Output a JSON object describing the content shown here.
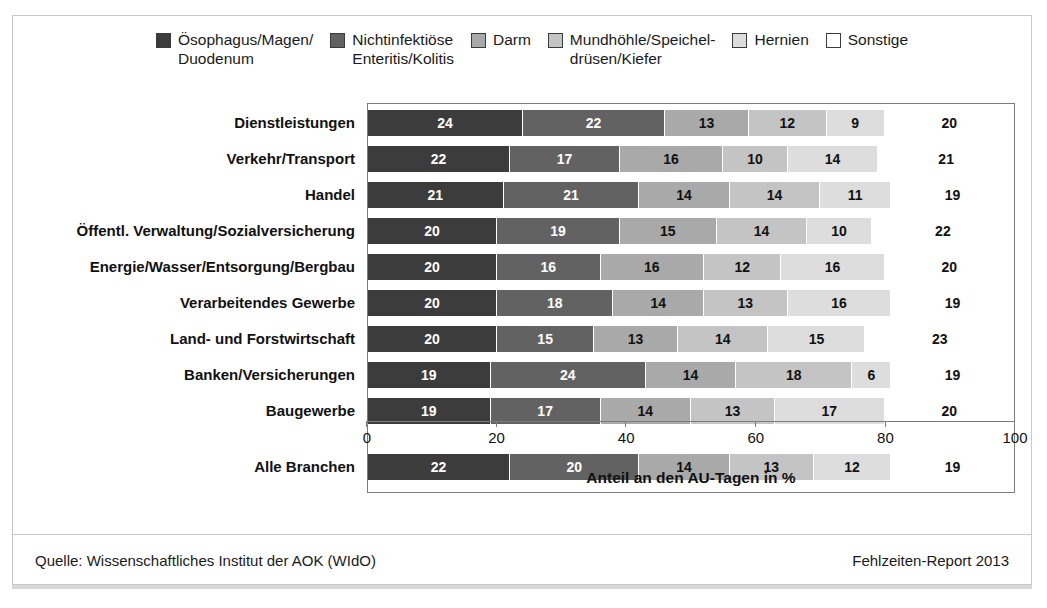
{
  "legend": {
    "items": [
      {
        "label": "Ösophagus/Magen/\nDuodenum",
        "color": "#3c3c3c",
        "icon": "legend-swatch-icon"
      },
      {
        "label": "Nichtinfektiöse\nEnteritis/Kolitis",
        "color": "#626262",
        "icon": "legend-swatch-icon"
      },
      {
        "label": "Darm",
        "color": "#a9a9a9",
        "icon": "legend-swatch-icon"
      },
      {
        "label": "Mundhöhle/Speichel-\ndrüsen/Kiefer",
        "color": "#c4c4c4",
        "icon": "legend-swatch-icon"
      },
      {
        "label": "Hernien",
        "color": "#dddddd",
        "icon": "legend-swatch-icon"
      },
      {
        "label": "Sonstige",
        "color": "#ffffff",
        "icon": "legend-swatch-icon"
      }
    ]
  },
  "axis": {
    "ticks": [
      "0",
      "20",
      "40",
      "60",
      "80",
      "100"
    ],
    "title": "Anteil an den AU-Tagen in %"
  },
  "footer": {
    "source": "Quelle: Wissenschaftliches Institut der AOK (WIdO)",
    "report": "Fehlzeiten-Report 2013"
  },
  "chart_data": {
    "type": "bar",
    "orientation": "horizontal",
    "stacked": true,
    "stack_total_percent": 100,
    "title": "",
    "xlabel": "Anteil an den AU-Tagen in %",
    "ylabel": "",
    "xlim": [
      0,
      100
    ],
    "xticks": [
      0,
      20,
      40,
      60,
      80,
      100
    ],
    "grid": false,
    "legend_position": "top",
    "categories": [
      "Dienstleistungen",
      "Verkehr/Transport",
      "Handel",
      "Öffentl. Verwaltung/Sozialversicherung",
      "Energie/Wasser/Entsorgung/Bergbau",
      "Verarbeitendes Gewerbe",
      "Land- und Forstwirtschaft",
      "Banken/Versicherungen",
      "Baugewerbe",
      "Alle Branchen"
    ],
    "series": [
      {
        "name": "Ösophagus/Magen/Duodenum",
        "color": "#3c3c3c",
        "values": [
          24,
          22,
          21,
          20,
          20,
          20,
          20,
          19,
          19,
          22
        ]
      },
      {
        "name": "Nichtinfektiöse Enteritis/Kolitis",
        "color": "#626262",
        "values": [
          22,
          17,
          21,
          19,
          16,
          18,
          15,
          24,
          17,
          20
        ]
      },
      {
        "name": "Darm",
        "color": "#a9a9a9",
        "values": [
          13,
          16,
          14,
          15,
          16,
          14,
          13,
          14,
          14,
          14
        ]
      },
      {
        "name": "Mundhöhle/Speicheldrüsen/Kiefer",
        "color": "#c4c4c4",
        "values": [
          12,
          10,
          14,
          14,
          12,
          13,
          14,
          18,
          13,
          13
        ]
      },
      {
        "name": "Hernien",
        "color": "#dddddd",
        "values": [
          9,
          14,
          11,
          10,
          16,
          16,
          15,
          6,
          17,
          12
        ]
      },
      {
        "name": "Sonstige",
        "color": "#ffffff",
        "values": [
          20,
          21,
          19,
          22,
          20,
          19,
          23,
          19,
          20,
          19
        ]
      }
    ],
    "separator_before_last_category": true
  }
}
